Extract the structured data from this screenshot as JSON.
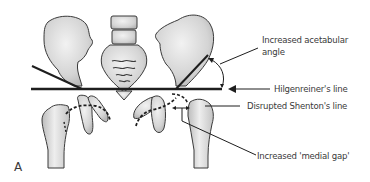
{
  "figure": {
    "panel_label": "A",
    "annotations": [
      {
        "id": "acetabular-angle",
        "line1": "Increased acetabular",
        "line2": "angle"
      },
      {
        "id": "hilgenreiner",
        "text": "Hilgenreiner's line"
      },
      {
        "id": "shenton",
        "text": "Disrupted Shenton's line"
      },
      {
        "id": "medial-gap",
        "text": "Increased 'medial gap'"
      }
    ],
    "colors": {
      "bone_fill": "#d9d9d9",
      "bone_shade": "#bdbdbd",
      "outline": "#3a3a3a",
      "line": "#1e1e1e",
      "text": "#3a3a3a"
    }
  }
}
